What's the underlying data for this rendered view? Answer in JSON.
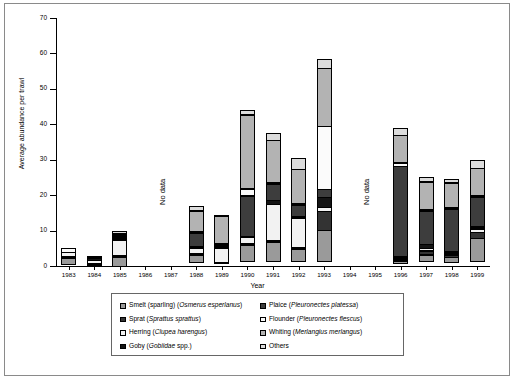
{
  "chart_data": {
    "type": "bar",
    "stacked": true,
    "title": "",
    "xlabel": "Year",
    "ylabel": "Average abundance per trawl",
    "ylim": [
      0,
      70
    ],
    "ytick_interval": 10,
    "yticks": [
      0,
      10,
      20,
      30,
      40,
      50,
      60,
      70
    ],
    "grid": false,
    "legend_position": "bottom",
    "categories": [
      "1983",
      "1984",
      "1985",
      "1986",
      "1987",
      "1988",
      "1989",
      "1990",
      "1991",
      "1992",
      "1993",
      "1994",
      "1995",
      "1996",
      "1997",
      "1998",
      "1999"
    ],
    "no_data_years": [
      "1986",
      "1987",
      "1994",
      "1995"
    ],
    "no_data_label": "No data",
    "series": [
      {
        "name": "Smelt (sparling) (Osmerus esperlanus)",
        "short": "Smelt",
        "color": "#9a9a9a",
        "values": [
          2.0,
          0.0,
          2.9,
          0,
          0,
          2.1,
          0.0,
          4.8,
          5.5,
          3.8,
          9.0,
          0,
          0,
          0.9,
          2.0,
          1.6,
          6.8
        ]
      },
      {
        "name": "Sprat (Sprattus sprattus)",
        "short": "Sprat",
        "color": "#333333",
        "values": [
          0.3,
          0.3,
          0.5,
          0,
          0,
          0.6,
          0.4,
          0.5,
          0.6,
          0.6,
          5.5,
          0,
          0,
          0.6,
          1.3,
          0.8,
          1.8
        ]
      },
      {
        "name": "Herring (Clupea harengus)",
        "short": "Herring",
        "color": "#f2f2f2",
        "values": [
          1.5,
          1.1,
          4.6,
          0,
          0,
          1.7,
          4.2,
          2.0,
          10.5,
          8.5,
          1.2,
          0,
          0,
          0.2,
          0.9,
          0.4,
          1.2
        ]
      },
      {
        "name": "Goby (Gobiidae spp.)",
        "short": "Goby",
        "color": "#141414",
        "values": [
          0.0,
          0.9,
          0.3,
          0,
          0,
          0.4,
          0.5,
          0.5,
          1.3,
          0.6,
          3.0,
          0,
          0,
          0.4,
          1.3,
          0.7,
          0.7
        ]
      },
      {
        "name": "Plaice (Pleuronectes platessa)",
        "short": "Plaice",
        "color": "#3d3d3d",
        "values": [
          0.0,
          0.0,
          0.2,
          0,
          0,
          4.0,
          0.6,
          11.5,
          4.8,
          3.2,
          2.4,
          0,
          0,
          25.5,
          9.5,
          12.2,
          8.6
        ]
      },
      {
        "name": "Flounder (Pleuronectes flescus)",
        "short": "Flounder",
        "color": "#fbfbfb",
        "values": [
          1.2,
          0.4,
          0.2,
          0,
          0,
          0.5,
          0.4,
          2.2,
          0.6,
          0.5,
          18.0,
          0,
          0,
          1.2,
          0.6,
          0.4,
          0.5
        ]
      },
      {
        "name": "Whiting (Merlangius merlangus)",
        "short": "Whiting",
        "color": "#b3b3b3",
        "values": [
          0.0,
          0.0,
          0.2,
          0,
          0,
          6.2,
          8.0,
          21.0,
          12.0,
          10.0,
          16.5,
          0,
          0,
          8.0,
          8.0,
          7.2,
          7.8
        ]
      },
      {
        "name": "Others",
        "short": "Others",
        "color": "#dcdcdc",
        "values": [
          0.0,
          0.0,
          1.1,
          0,
          0,
          1.5,
          0.4,
          1.5,
          2.2,
          3.3,
          2.9,
          0,
          0,
          2.2,
          1.4,
          1.2,
          2.6
        ]
      }
    ],
    "totals": [
      5.0,
      2.7,
      10.0,
      0,
      0,
      17.0,
      14.5,
      44.0,
      37.5,
      30.5,
      58.5,
      0,
      0,
      39.0,
      25.0,
      24.5,
      30.0
    ]
  },
  "axes": {
    "y_title": "Average abundance per trawl",
    "x_title": "Year"
  },
  "legend": {
    "left_items": [
      {
        "label": "Smelt (sparling) (Osmerus esperlanus)",
        "plain": "Smelt (sparling) (",
        "italic": "Osmerus esperlanus",
        "tail": ")",
        "color": "#9a9a9a"
      },
      {
        "label": "Sprat (Sprattus sprattus)",
        "plain": "Sprat (",
        "italic": "Sprattus sprattus",
        "tail": ")",
        "color": "#333333"
      },
      {
        "label": "Herring (Clupea harengus)",
        "plain": "Herring (",
        "italic": "Clupea harengus",
        "tail": ")",
        "color": "#f2f2f2"
      },
      {
        "label": "Goby (Gobiidae spp.)",
        "plain": "Goby (",
        "italic": "Gobiidae",
        "tail": " spp.)",
        "color": "#141414"
      }
    ],
    "right_items": [
      {
        "label": "Plaice (Pleuronectes platessa)",
        "plain": "Plaice (",
        "italic": "Pleuronectes platessa",
        "tail": ")",
        "color": "#3d3d3d"
      },
      {
        "label": "Flounder (Pleuronectes flescus)",
        "plain": "Flounder (",
        "italic": "Pleuronectes flescus",
        "tail": ")",
        "color": "#fbfbfb"
      },
      {
        "label": "Whiting (Merlangius merlangus)",
        "plain": "Whiting (",
        "italic": "Merlangius merlangus",
        "tail": ")",
        "color": "#b3b3b3"
      },
      {
        "label": "Others",
        "plain": "Others",
        "italic": "",
        "tail": "",
        "color": "#dcdcdc"
      }
    ]
  }
}
